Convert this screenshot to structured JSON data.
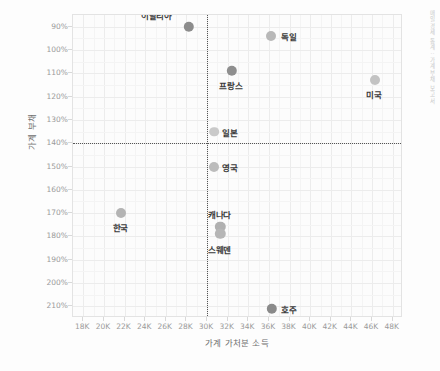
{
  "chart_data": {
    "type": "scatter",
    "title": "",
    "xlabel": "가계 가처분 소득",
    "ylabel": "가계 부채",
    "xlim": [
      17000,
      49000
    ],
    "ylim": [
      85,
      215
    ],
    "y_inverted": true,
    "grid": true,
    "legend": false,
    "xticks": [
      "18K",
      "20K",
      "22K",
      "24K",
      "26K",
      "28K",
      "30K",
      "32K",
      "34K",
      "36K",
      "38K",
      "40K",
      "42K",
      "44K",
      "46K",
      "48K"
    ],
    "xtick_values": [
      18000,
      20000,
      22000,
      24000,
      26000,
      28000,
      30000,
      32000,
      34000,
      36000,
      38000,
      40000,
      42000,
      44000,
      46000,
      48000
    ],
    "yticks": [
      "90%",
      "100%",
      "110%",
      "120%",
      "130%",
      "140%",
      "150%",
      "160%",
      "170%",
      "180%",
      "190%",
      "200%",
      "210%"
    ],
    "ytick_values": [
      90,
      100,
      110,
      120,
      130,
      140,
      150,
      160,
      170,
      180,
      190,
      200,
      210
    ],
    "reference_lines": {
      "vertical_x": 30000,
      "horizontal_y": 140
    },
    "points": [
      {
        "name": "이탈리아",
        "x": 28200,
        "y": 90,
        "label_dx": -32,
        "label_dy": -12,
        "r": 5.2,
        "color": "#8c8c8c"
      },
      {
        "name": "독일",
        "x": 36200,
        "y": 94,
        "label_dx": 18,
        "label_dy": 0,
        "r": 5.0,
        "color": "#b8b8b8"
      },
      {
        "name": "프랑스",
        "x": 32400,
        "y": 109,
        "label_dx": -1,
        "label_dy": 14,
        "r": 5.2,
        "color": "#8f8f8f"
      },
      {
        "name": "미국",
        "x": 46300,
        "y": 113,
        "label_dx": -1,
        "label_dy": 14,
        "r": 5.0,
        "color": "#c3c3c3"
      },
      {
        "name": "일본",
        "x": 30700,
        "y": 135,
        "label_dx": 16,
        "label_dy": 0,
        "r": 4.8,
        "color": "#c9c9c9"
      },
      {
        "name": "영국",
        "x": 30700,
        "y": 150,
        "label_dx": 16,
        "label_dy": 0,
        "r": 5.0,
        "color": "#bcbcbc"
      },
      {
        "name": "한국",
        "x": 21700,
        "y": 170,
        "label_dx": -1,
        "label_dy": 14,
        "r": 5.0,
        "color": "#b4b4b4"
      },
      {
        "name": "캐나다",
        "x": 31300,
        "y": 176,
        "label_dx": -1,
        "label_dy": -13,
        "r": 5.2,
        "color": "#b0b0b0"
      },
      {
        "name": "스웨덴",
        "x": 31300,
        "y": 179,
        "label_dx": -1,
        "label_dy": 15,
        "r": 5.2,
        "color": "#b6b6b6"
      },
      {
        "name": "호주",
        "x": 36300,
        "y": 211,
        "label_dx": 17,
        "label_dy": 0,
        "r": 5.2,
        "color": "#8a8a8a"
      }
    ]
  },
  "watermark": "매일경제 통계 : 가계부채 보고서"
}
